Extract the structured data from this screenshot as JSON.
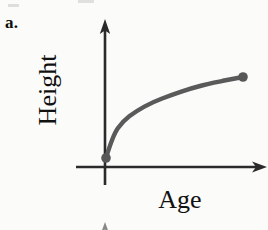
{
  "figure": {
    "part_label": "a.",
    "background_color": "#fbfbfa",
    "axis_color": "#2a2a2a",
    "curve_color": "#5a5a5a",
    "point_color": "#575757"
  },
  "chart_data": {
    "type": "line",
    "title": "",
    "subtitle": "",
    "xlabel": "Age",
    "ylabel": "Height",
    "grid": false,
    "legend": null,
    "annotations": [],
    "axis_style": "arrow-headed, unlabeled qualitative axes",
    "xlim": [
      0,
      1
    ],
    "ylim": [
      0,
      1
    ],
    "xticks": [],
    "yticks": [],
    "series": [
      {
        "name": "Height vs Age",
        "shape": "increasing concave-down",
        "x": [
          0.0,
          0.05,
          0.12,
          0.22,
          0.34,
          0.48,
          0.62,
          0.78,
          1.0
        ],
        "y": [
          0.0,
          0.28,
          0.45,
          0.58,
          0.69,
          0.78,
          0.86,
          0.93,
          1.0
        ]
      }
    ],
    "markers": [
      {
        "name": "origin-endpoint",
        "x": 0.0,
        "y": 0.0
      },
      {
        "name": "right-endpoint",
        "x": 1.0,
        "y": 1.0
      }
    ]
  }
}
